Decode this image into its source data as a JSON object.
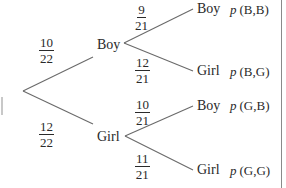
{
  "tree": {
    "level1": {
      "boy": {
        "label": "Boy",
        "prob_num": "10",
        "prob_den": "22"
      },
      "girl": {
        "label": "Girl",
        "prob_num": "12",
        "prob_den": "22"
      }
    },
    "level2": {
      "boy_boy": {
        "label": "Boy",
        "prob_num": "9",
        "prob_den": "21",
        "outcome_p": "p",
        "outcome": "(B,B)"
      },
      "boy_girl": {
        "label": "Girl",
        "prob_num": "12",
        "prob_den": "21",
        "outcome_p": "p",
        "outcome": "(B,G)"
      },
      "girl_boy": {
        "label": "Boy",
        "prob_num": "10",
        "prob_den": "21",
        "outcome_p": "p",
        "outcome": "(G,B)"
      },
      "girl_girl": {
        "label": "Girl",
        "prob_num": "11",
        "prob_den": "21",
        "outcome_p": "p",
        "outcome": "(G,G)"
      }
    }
  },
  "colors": {
    "line": "#6a6a6a",
    "text": "#2a2a2a",
    "background": "#ffffff"
  }
}
